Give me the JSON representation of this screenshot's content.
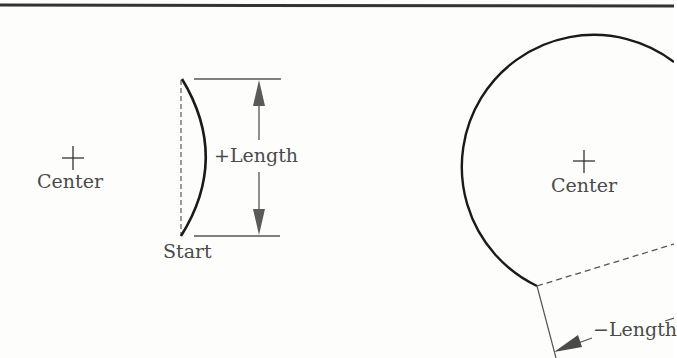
{
  "diagram": {
    "type": "arc-length-sign-convention",
    "left_panel": {
      "center_label": "Center",
      "start_label": "Start",
      "length_label": "+Length",
      "description": "Short arc with positive length; dimension arrows show arc length between start and end."
    },
    "right_panel": {
      "center_label": "Center",
      "length_label": "−Length",
      "description": "Large arc (most of a circle) with negative length; dashed chord and perpendicular dimension line."
    },
    "colors": {
      "background": "#fdfdfc",
      "border": "#333333",
      "arc": "#1a1a1a",
      "dimension_line": "#555555",
      "arrow": "#5a5a5a",
      "text": "#4a4a4a"
    },
    "icons": {
      "center_marker": "plus-cross",
      "dimension_arrow": "filled-triangle-arrowhead"
    }
  }
}
